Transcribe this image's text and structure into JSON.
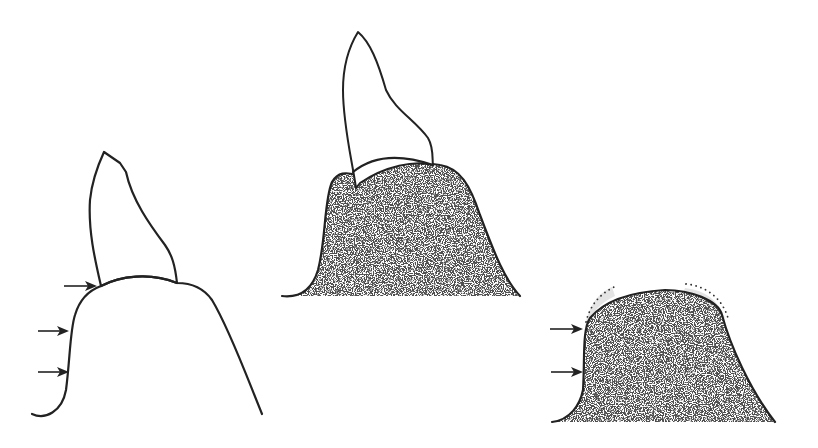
{
  "figure": {
    "panels": [
      {
        "id": "left",
        "label": "",
        "fill": "none",
        "arrows": 3
      },
      {
        "id": "middle",
        "label": "",
        "fill": "stippled",
        "arrows": 0
      },
      {
        "id": "right",
        "label": "",
        "fill": "stippled",
        "arrows": 2,
        "dotted_margins": 2
      }
    ],
    "colors": {
      "line": "#222222",
      "stipple": "#1a1a1a",
      "background": "#ffffff",
      "halo": "#d9d9d9"
    }
  }
}
